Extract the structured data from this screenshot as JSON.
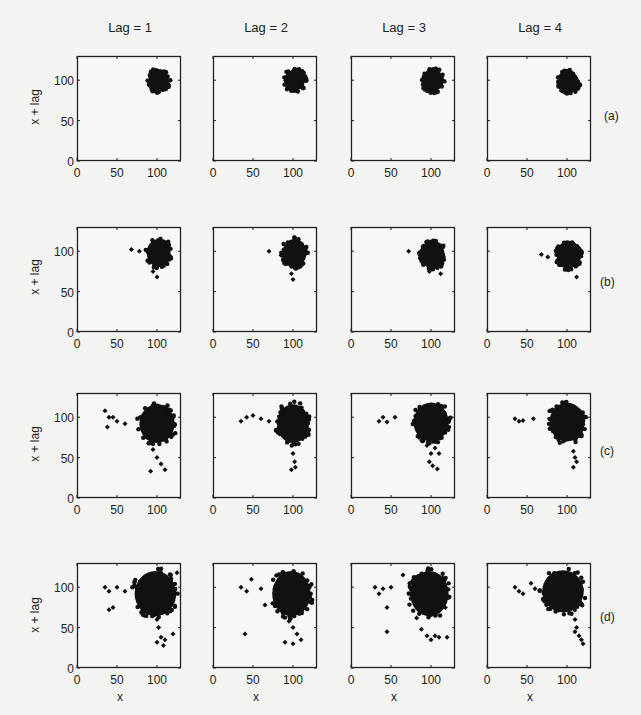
{
  "figure": {
    "column_titles": [
      "Lag = 1",
      "Lag = 2",
      "Lag = 3",
      "Lag = 4"
    ],
    "row_labels": [
      "(a)",
      "(b)",
      "(c)",
      "(d)"
    ],
    "ylabel": "x + lag",
    "xlabel": "x"
  },
  "chart_data": {
    "type": "scatter",
    "title": "",
    "layout": "4x4 grid of lag plots",
    "xlabel": "x",
    "ylabel": "x + lag",
    "xlim": [
      0,
      130
    ],
    "ylim": [
      0,
      130
    ],
    "xticks": [
      0,
      50,
      100
    ],
    "yticks": [
      0,
      50,
      100
    ],
    "grid": false,
    "columns": [
      "Lag = 1",
      "Lag = 2",
      "Lag = 3",
      "Lag = 4"
    ],
    "rows": [
      "(a)",
      "(b)",
      "(c)",
      "(d)"
    ],
    "panels": [
      [
        {
          "row": "(a)",
          "lag": 1,
          "cluster": {
            "cx": 102,
            "cy": 100,
            "rx": 13,
            "ry": 14
          },
          "outliers": []
        },
        {
          "row": "(a)",
          "lag": 2,
          "cluster": {
            "cx": 102,
            "cy": 100,
            "rx": 13,
            "ry": 13
          },
          "outliers": []
        },
        {
          "row": "(a)",
          "lag": 3,
          "cluster": {
            "cx": 102,
            "cy": 100,
            "rx": 13,
            "ry": 14
          },
          "outliers": []
        },
        {
          "row": "(a)",
          "lag": 4,
          "cluster": {
            "cx": 102,
            "cy": 98,
            "rx": 13,
            "ry": 13
          },
          "outliers": []
        }
      ],
      [
        {
          "row": "(b)",
          "lag": 1,
          "cluster": {
            "cx": 102,
            "cy": 98,
            "rx": 15,
            "ry": 17
          },
          "outliers": [
            [
              68,
              102
            ],
            [
              78,
              100
            ],
            [
              95,
              75
            ],
            [
              100,
              68
            ]
          ]
        },
        {
          "row": "(b)",
          "lag": 2,
          "cluster": {
            "cx": 102,
            "cy": 98,
            "rx": 15,
            "ry": 17
          },
          "outliers": [
            [
              70,
              100
            ],
            [
              85,
              95
            ],
            [
              98,
              72
            ],
            [
              100,
              65
            ]
          ]
        },
        {
          "row": "(b)",
          "lag": 3,
          "cluster": {
            "cx": 102,
            "cy": 96,
            "rx": 15,
            "ry": 17
          },
          "outliers": [
            [
              72,
              100
            ],
            [
              85,
              98
            ],
            [
              98,
              75
            ],
            [
              112,
              72
            ]
          ]
        },
        {
          "row": "(b)",
          "lag": 4,
          "cluster": {
            "cx": 102,
            "cy": 96,
            "rx": 15,
            "ry": 17
          },
          "outliers": [
            [
              68,
              96
            ],
            [
              76,
              93
            ],
            [
              98,
              78
            ],
            [
              112,
              68
            ]
          ]
        }
      ],
      [
        {
          "row": "(c)",
          "lag": 1,
          "cluster": {
            "cx": 100,
            "cy": 92,
            "rx": 22,
            "ry": 24
          },
          "outliers": [
            [
              35,
              108
            ],
            [
              40,
              100
            ],
            [
              38,
              88
            ],
            [
              45,
              100
            ],
            [
              50,
              95
            ],
            [
              60,
              92
            ],
            [
              95,
              60
            ],
            [
              100,
              50
            ],
            [
              105,
              42
            ],
            [
              92,
              33
            ],
            [
              110,
              35
            ]
          ]
        },
        {
          "row": "(c)",
          "lag": 2,
          "cluster": {
            "cx": 100,
            "cy": 92,
            "rx": 20,
            "ry": 24
          },
          "outliers": [
            [
              35,
              95
            ],
            [
              42,
              100
            ],
            [
              50,
              102
            ],
            [
              60,
              98
            ],
            [
              70,
              95
            ],
            [
              100,
              55
            ],
            [
              102,
              45
            ],
            [
              98,
              35
            ],
            [
              103,
              38
            ]
          ]
        },
        {
          "row": "(c)",
          "lag": 3,
          "cluster": {
            "cx": 100,
            "cy": 94,
            "rx": 22,
            "ry": 24
          },
          "outliers": [
            [
              35,
              95
            ],
            [
              40,
              100
            ],
            [
              45,
              94
            ],
            [
              55,
              100
            ],
            [
              85,
              75
            ],
            [
              95,
              65
            ],
            [
              105,
              62
            ],
            [
              100,
              55
            ],
            [
              110,
              55
            ],
            [
              98,
              45
            ],
            [
              102,
              40
            ],
            [
              108,
              36
            ]
          ]
        },
        {
          "row": "(c)",
          "lag": 4,
          "cluster": {
            "cx": 100,
            "cy": 94,
            "rx": 22,
            "ry": 24
          },
          "outliers": [
            [
              35,
              98
            ],
            [
              40,
              95
            ],
            [
              45,
              96
            ],
            [
              58,
              98
            ],
            [
              95,
              70
            ],
            [
              110,
              72
            ],
            [
              108,
              58
            ],
            [
              110,
              50
            ],
            [
              112,
              45
            ],
            [
              108,
              38
            ]
          ]
        }
      ],
      [
        {
          "row": "(d)",
          "lag": 1,
          "cluster": {
            "cx": 98,
            "cy": 92,
            "rx": 26,
            "ry": 28
          },
          "outliers": [
            [
              35,
              100
            ],
            [
              40,
              95
            ],
            [
              50,
              100
            ],
            [
              40,
              72
            ],
            [
              45,
              75
            ],
            [
              60,
              95
            ],
            [
              100,
              60
            ],
            [
              102,
              50
            ],
            [
              105,
              38
            ],
            [
              100,
              32
            ],
            [
              110,
              35
            ],
            [
              108,
              28
            ],
            [
              120,
              42
            ],
            [
              125,
              118
            ]
          ]
        },
        {
          "row": "(d)",
          "lag": 2,
          "cluster": {
            "cx": 98,
            "cy": 92,
            "rx": 24,
            "ry": 28
          },
          "outliers": [
            [
              35,
              100
            ],
            [
              42,
              95
            ],
            [
              48,
              110
            ],
            [
              60,
              98
            ],
            [
              65,
              78
            ],
            [
              40,
              42
            ],
            [
              95,
              58
            ],
            [
              100,
              50
            ],
            [
              105,
              42
            ],
            [
              90,
              32
            ],
            [
              100,
              30
            ],
            [
              110,
              35
            ]
          ]
        },
        {
          "row": "(d)",
          "lag": 3,
          "cluster": {
            "cx": 98,
            "cy": 92,
            "rx": 24,
            "ry": 28
          },
          "outliers": [
            [
              30,
              100
            ],
            [
              35,
              92
            ],
            [
              40,
              98
            ],
            [
              50,
              100
            ],
            [
              65,
              115
            ],
            [
              45,
              75
            ],
            [
              45,
              45
            ],
            [
              82,
              62
            ],
            [
              88,
              48
            ],
            [
              95,
              40
            ],
            [
              100,
              35
            ],
            [
              105,
              40
            ],
            [
              110,
              38
            ],
            [
              120,
              38
            ],
            [
              118,
              75
            ]
          ]
        },
        {
          "row": "(d)",
          "lag": 4,
          "cluster": {
            "cx": 95,
            "cy": 95,
            "rx": 26,
            "ry": 26
          },
          "outliers": [
            [
              35,
              100
            ],
            [
              40,
              95
            ],
            [
              45,
              92
            ],
            [
              55,
              105
            ],
            [
              60,
              98
            ],
            [
              110,
              60
            ],
            [
              112,
              50
            ],
            [
              115,
              40
            ],
            [
              118,
              35
            ],
            [
              120,
              30
            ],
            [
              110,
              45
            ]
          ]
        }
      ]
    ]
  }
}
